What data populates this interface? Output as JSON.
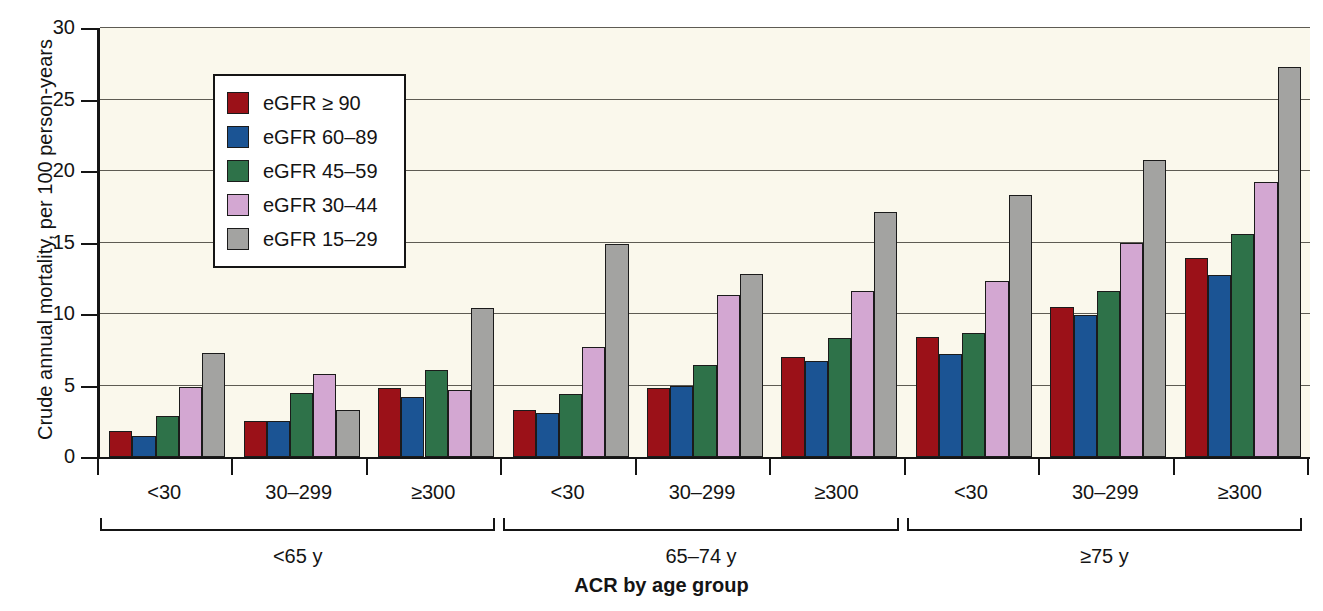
{
  "chart_data": {
    "type": "bar",
    "title": "",
    "xlabel": "ACR by age group",
    "ylabel": "Crude annual mortality, per 100 person-years",
    "ylim": [
      0,
      30
    ],
    "yticks": [
      0,
      5,
      10,
      15,
      20,
      25,
      30
    ],
    "ytick_labels": [
      "0",
      "5",
      "10",
      "15",
      "20",
      "25",
      "30"
    ],
    "grid": true,
    "legend_position": "upper-left-inside",
    "categories": [
      "<30",
      "30–299",
      "≥300",
      "<30",
      "30–299",
      "≥300",
      "<30",
      "30–299",
      "≥300"
    ],
    "age_groups": [
      {
        "label": "<65 y",
        "categories": [
          "<30",
          "30–299",
          "≥300"
        ]
      },
      {
        "label": "65–74 y",
        "categories": [
          "<30",
          "30–299",
          "≥300"
        ]
      },
      {
        "label": "≥75 y",
        "categories": [
          "<30",
          "30–299",
          "≥300"
        ]
      }
    ],
    "series": [
      {
        "name": "eGFR ≥ 90",
        "color": "#9b1118",
        "values": [
          1.8,
          2.5,
          4.8,
          3.3,
          4.8,
          7.0,
          8.4,
          10.5,
          13.9
        ]
      },
      {
        "name": "eGFR 60–89",
        "color": "#1b5494",
        "values": [
          1.5,
          2.5,
          4.2,
          3.1,
          5.0,
          6.7,
          7.2,
          9.9,
          12.7
        ]
      },
      {
        "name": "eGFR 45–59",
        "color": "#2e7249",
        "values": [
          2.9,
          4.5,
          6.1,
          4.4,
          6.4,
          8.3,
          8.7,
          11.6,
          15.6
        ]
      },
      {
        "name": "eGFR 30–44",
        "color": "#d3a7d2",
        "values": [
          4.9,
          5.8,
          4.7,
          7.7,
          11.3,
          11.6,
          12.3,
          15.0,
          19.2
        ]
      },
      {
        "name": "eGFR 15–29",
        "color": "#a3a3a1",
        "values": [
          7.3,
          3.3,
          10.4,
          14.9,
          12.8,
          17.1,
          18.3,
          20.8,
          27.3
        ]
      }
    ]
  }
}
